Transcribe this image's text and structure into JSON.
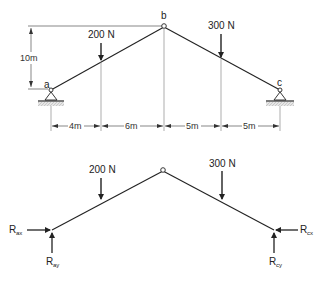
{
  "top_diagram": {
    "nodes": {
      "a": {
        "label": "a"
      },
      "b": {
        "label": "b"
      },
      "c": {
        "label": "c"
      }
    },
    "loads": [
      {
        "label": "200 N"
      },
      {
        "label": "300 N"
      }
    ],
    "height_dimension": "10m",
    "span_dimensions": [
      "4m",
      "6m",
      "5m",
      "5m"
    ]
  },
  "free_body_diagram": {
    "loads": [
      {
        "label": "200 N"
      },
      {
        "label": "300 N"
      }
    ],
    "reactions": {
      "R_ax": {
        "main": "R",
        "sub": "ax"
      },
      "R_ay": {
        "main": "R",
        "sub": "ay"
      },
      "R_cx": {
        "main": "R",
        "sub": "cx"
      },
      "R_cy": {
        "main": "R",
        "sub": "cy"
      }
    }
  }
}
